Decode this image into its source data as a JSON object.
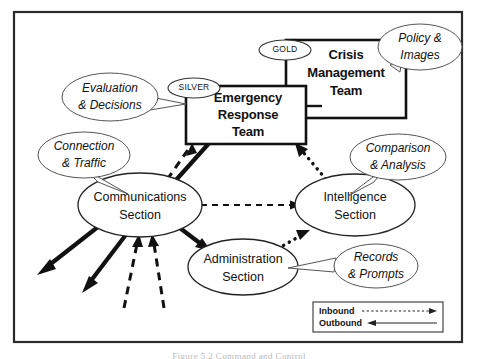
{
  "figure": {
    "caption": "Figure 5.2 Command and Control",
    "frame": {
      "x": 14,
      "y": 12,
      "width": 448,
      "height": 330
    }
  },
  "boxes": [
    {
      "id": "crisis-management-team",
      "label_lines": [
        "Crisis",
        "Management",
        "Team"
      ],
      "tag": "GOLD"
    },
    {
      "id": "emergency-response-team",
      "label_lines": [
        "Emergency",
        "Response",
        "Team"
      ],
      "tag": "SILVER"
    }
  ],
  "sections": [
    {
      "id": "communications-section",
      "label_lines": [
        "Communications",
        "Section"
      ]
    },
    {
      "id": "intelligence-section",
      "label_lines": [
        "Intelligence",
        "Section"
      ]
    },
    {
      "id": "administration-section",
      "label_lines": [
        "Administration",
        "Section"
      ]
    }
  ],
  "callouts": [
    {
      "id": "policy-images",
      "label_lines": [
        "Policy &",
        "Images"
      ],
      "points_to": "crisis-management-team"
    },
    {
      "id": "evaluation-decisions",
      "label_lines": [
        "Evaluation",
        "& Decisions"
      ],
      "points_to": "emergency-response-team"
    },
    {
      "id": "connection-traffic",
      "label_lines": [
        "Connection",
        "& Traffic"
      ],
      "points_to": "communications-section"
    },
    {
      "id": "comparison-analysis",
      "label_lines": [
        "Comparison",
        "& Analysis"
      ],
      "points_to": "intelligence-section"
    },
    {
      "id": "records-prompts",
      "label_lines": [
        "Records",
        "& Prompts"
      ],
      "points_to": "administration-section"
    }
  ],
  "legend": {
    "items": [
      {
        "id": "inbound",
        "label": "Inbound",
        "style": "dashed",
        "direction": "right"
      },
      {
        "id": "outbound",
        "label": "Outbound",
        "style": "solid",
        "direction": "left"
      }
    ]
  },
  "flows": [
    {
      "id": "comms-to-ert",
      "from": "communications-section",
      "to": "emergency-response-team",
      "style": "inbound-dashed"
    },
    {
      "id": "ert-to-comms",
      "from": "emergency-response-team",
      "to": "communications-section",
      "style": "outbound-solid"
    },
    {
      "id": "comms-to-intel",
      "from": "communications-section",
      "to": "intelligence-section",
      "style": "inbound-dashed"
    },
    {
      "id": "intel-to-ert",
      "from": "intelligence-section",
      "to": "emergency-response-team",
      "style": "inbound-dotted"
    },
    {
      "id": "admin-to-intel",
      "from": "administration-section",
      "to": "intelligence-section",
      "style": "inbound-dotted"
    },
    {
      "id": "comms-to-admin",
      "from": "communications-section",
      "to": "administration-section",
      "style": "outbound-solid"
    },
    {
      "id": "comms-outbound-1",
      "from": "communications-section",
      "to": "external",
      "style": "outbound-solid"
    },
    {
      "id": "comms-outbound-2",
      "from": "communications-section",
      "to": "external",
      "style": "outbound-solid"
    },
    {
      "id": "comms-inbound-1",
      "from": "external",
      "to": "communications-section",
      "style": "inbound-dashed"
    },
    {
      "id": "comms-inbound-2",
      "from": "external",
      "to": "communications-section",
      "style": "inbound-dashed"
    }
  ]
}
